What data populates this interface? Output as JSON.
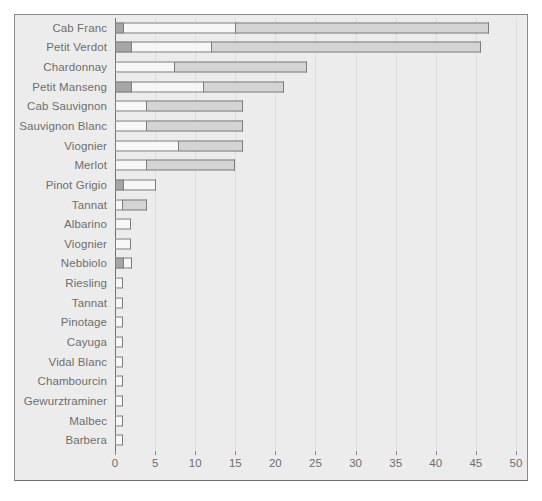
{
  "chart_data": {
    "type": "bar",
    "orientation": "horizontal",
    "stacked": true,
    "title": "",
    "subtitle": "",
    "xlabel": "",
    "ylabel": "",
    "xlim": [
      0,
      51.5
    ],
    "xticks": [
      0,
      5,
      10,
      15,
      20,
      25,
      30,
      35,
      40,
      45,
      50
    ],
    "grid": true,
    "grid_axis": "x",
    "legend": null,
    "legend_position": "none",
    "categories": [
      "Cab Franc",
      "Petit Verdot",
      "Chardonnay",
      "Petit Manseng",
      "Cab Sauvignon",
      "Sauvignon Blanc",
      "Viognier",
      "Merlot",
      "Pinot Grigio",
      "Tannat",
      "Albarino",
      "Viognier",
      "Nebbiolo",
      "Riesling",
      "Tannat",
      "Pinotage",
      "Cayuga",
      "Vidal Blanc",
      "Chambourcin",
      "Gewurztraminer",
      "Malbec",
      "Barbera"
    ],
    "series": [
      {
        "name": "segment-1",
        "color": "#a6a6a6",
        "values": [
          1,
          2,
          0,
          2,
          0,
          0,
          0,
          0,
          1,
          0,
          0,
          0,
          1,
          0,
          0,
          0,
          0,
          0,
          0,
          0,
          0,
          0
        ]
      },
      {
        "name": "segment-2",
        "color": "#f7f7f7",
        "values": [
          14,
          10,
          7.5,
          9,
          4,
          4,
          8,
          4,
          4,
          1,
          2,
          2,
          1,
          1,
          1,
          1,
          1,
          1,
          1,
          1,
          1,
          1
        ]
      },
      {
        "name": "segment-3",
        "color": "#d4d4d4",
        "values": [
          31.5,
          33.5,
          16.5,
          10,
          12,
          12,
          8,
          11,
          0,
          3,
          0,
          0,
          0,
          0,
          0,
          0,
          0,
          0,
          0,
          0,
          0,
          0
        ]
      }
    ],
    "totals": [
      46.5,
      45.5,
      24,
      21,
      16,
      16,
      16,
      15,
      5,
      4,
      2,
      2,
      2,
      1,
      1,
      1,
      1,
      1,
      1,
      1,
      1,
      1
    ]
  },
  "style": {
    "plot_background": "#ececec",
    "page_background": "#ffffff",
    "frame_color": "#8a8a8a",
    "axis_color": "#6f6f6f",
    "gridline_color": "#dedede",
    "label_color": "#6e6e6e",
    "bar_border_color": "#7d7d7d"
  }
}
